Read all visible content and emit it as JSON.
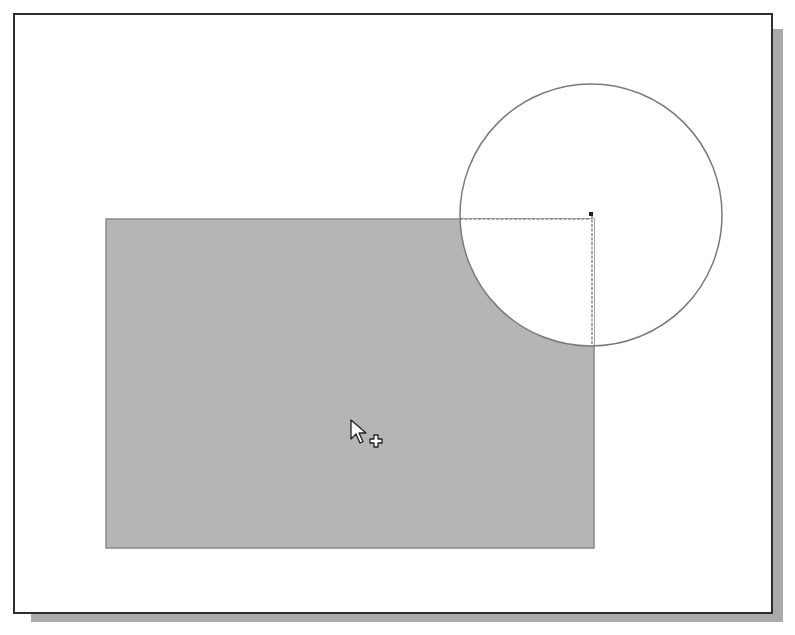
{
  "canvas": {
    "background_color": "#ffffff",
    "frame_border_color": "#2e2e2e",
    "frame_shadow_color": "#aaaaaa"
  },
  "shapes": {
    "rectangle": {
      "x": 106,
      "y": 219,
      "width": 488,
      "height": 329,
      "fill": "#b5b5b5",
      "stroke": "#8a8a8a"
    },
    "circle": {
      "cx": 591,
      "cy": 215,
      "r": 131,
      "stroke": "#7a7a7a",
      "fill": "none"
    },
    "overlap_region": {
      "fill": "#ffffff",
      "stroke": "#8a8a8a"
    },
    "center_marker": {
      "x": 589,
      "y": 212,
      "size": 4,
      "color": "#222222"
    }
  },
  "cursor": {
    "icon": "arrow-with-plus-icon",
    "x": 350,
    "y": 419
  }
}
